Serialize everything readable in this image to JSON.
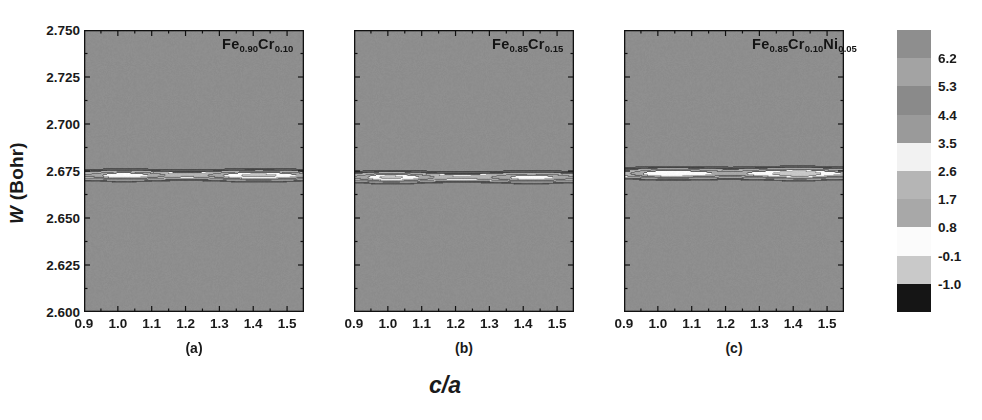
{
  "figure": {
    "xlabel": "c/a",
    "ylabel_italic": "W",
    "ylabel_rest": " (Bohr)"
  },
  "chart_data": {
    "type": "heatmap",
    "title": "",
    "xlabel": "c/a",
    "ylabel": "W (Bohr)",
    "xlim": [
      0.9,
      1.55
    ],
    "ylim": [
      2.6,
      2.75
    ],
    "xticks": [
      0.9,
      1.0,
      1.1,
      1.2,
      1.3,
      1.4,
      1.5
    ],
    "xtick_labels": [
      "0.9",
      "1.0",
      "1.1",
      "1.2",
      "1.3",
      "1.4",
      "1.5"
    ],
    "yticks": [
      2.6,
      2.625,
      2.65,
      2.675,
      2.7,
      2.725,
      2.75
    ],
    "ytick_labels": [
      "2.600",
      "2.625",
      "2.650",
      "2.675",
      "2.700",
      "2.725",
      "2.750"
    ],
    "grid": false,
    "legend_position": "right",
    "colorbar": {
      "levels": [
        6.2,
        5.3,
        4.4,
        3.5,
        2.6,
        1.7,
        0.8,
        -0.1,
        -1.0
      ],
      "level_labels": [
        "6.2",
        "5.3",
        "4.4",
        "3.5",
        "2.6",
        "1.7",
        "0.8",
        "-0.1",
        "-1.0"
      ],
      "colors": [
        "#8e8e8e",
        "#a3a3a3",
        "#8a8a8a",
        "#9a9a9a",
        "#f2f2f2",
        "#b5b5b5",
        "#a8a8a8",
        "#fbfbfb",
        "#c9c9c9",
        "#151515"
      ]
    },
    "panels": [
      {
        "id": "a",
        "panel_label": "(a)",
        "formula_parts": [
          {
            "el": "Fe",
            "sub": "0.90"
          },
          {
            "el": "Cr",
            "sub": "0.10"
          }
        ],
        "formula_text": "Fe0.90Cr0.10",
        "description": "Two dark minima basins near c/a=1.0 and c/a=1.4 at W~2.67, separated by a light saddle near c/a=1.22"
      },
      {
        "id": "b",
        "panel_label": "(b)",
        "formula_parts": [
          {
            "el": "Fe",
            "sub": "0.85"
          },
          {
            "el": "Cr",
            "sub": "0.15"
          }
        ],
        "formula_text": "Fe0.85Cr0.15",
        "description": "Large dark basin near c/a=1.0 and smaller basin near c/a=1.4, broad light region between"
      },
      {
        "id": "c",
        "panel_label": "(c)",
        "formula_parts": [
          {
            "el": "Fe",
            "sub": "0.85"
          },
          {
            "el": "Cr",
            "sub": "0.10"
          },
          {
            "el": "Ni",
            "sub": "0.05"
          }
        ],
        "formula_text": "Fe0.85Cr0.10Ni0.05",
        "description": "Broad light bowtie region spanning the panel with a single small dark minimum near c/a=1.42, W~2.665"
      }
    ]
  }
}
